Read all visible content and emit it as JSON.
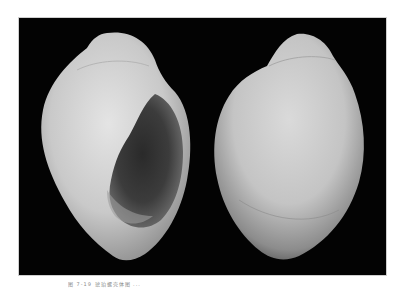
{
  "figure": {
    "background_color": "#030303",
    "views": [
      {
        "label": "apertural-view"
      },
      {
        "label": "abapertural-view"
      }
    ]
  },
  "caption": {
    "text": "图 7-19   琥珀螺壳体图 ..."
  }
}
